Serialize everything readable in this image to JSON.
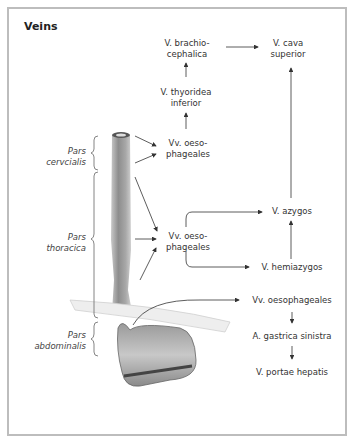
{
  "title": "Veins",
  "parts": {
    "cervicalis": [
      "Pars",
      "cervcialis"
    ],
    "thoracica": [
      "Pars",
      "thoracica"
    ],
    "abdominalis": [
      "Pars",
      "abdominalis"
    ]
  },
  "nodes": {
    "brachiocephalica": [
      "V. brachio-",
      "cephalica"
    ],
    "cava_superior": [
      "V. cava",
      "superior"
    ],
    "thyroidea_inferior": [
      "V. thyoridea",
      "inferior"
    ],
    "oeso_cervical": [
      "Vv. oeso-",
      "phageales"
    ],
    "oeso_thoracic": [
      "Vv. oeso-",
      "phageales"
    ],
    "azygos": "V. azygos",
    "hemiazygos": "V. hemiazygos",
    "oeso_abdominal": "Vv. oesophageales",
    "gastrica_sinistra": "A. gastrica sinistra",
    "portae_hepatis": "V. portae hepatis"
  },
  "colors": {
    "arrow": "#333333",
    "frame": "#bdbdbd",
    "brace": "#777777"
  }
}
